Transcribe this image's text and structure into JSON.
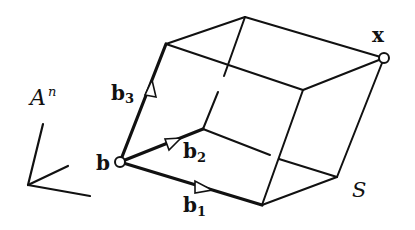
{
  "diagram": {
    "type": "parallelepiped-lattice-basis",
    "labels": {
      "space": "A",
      "space_superscript": "n",
      "origin": "b",
      "basis1": "b",
      "basis1_sub": "1",
      "basis2": "b",
      "basis2_sub": "2",
      "basis3": "b",
      "basis3_sub": "3",
      "corner": "x",
      "solid": "S"
    },
    "vertices": {
      "b": [
        120,
        162
      ],
      "b_plus_b1": [
        262,
        205
      ],
      "b_plus_b2": [
        203,
        129
      ],
      "b_plus_b3": [
        166,
        44
      ],
      "b_plus_b1_b2": [
        337,
        177
      ],
      "b_plus_b1_b3": [
        303,
        90
      ],
      "b_plus_b2_b3": [
        245,
        17
      ],
      "x": [
        384,
        58
      ]
    },
    "axes_origin": [
      28,
      185
    ],
    "colors": {
      "stroke": "#111111",
      "background": "#ffffff"
    }
  }
}
